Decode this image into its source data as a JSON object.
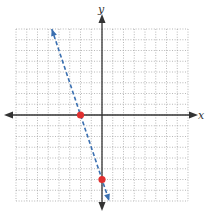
{
  "chart_data": {
    "type": "line",
    "title": "",
    "xlabel": "x",
    "ylabel": "y",
    "xlim": [
      -8,
      8
    ],
    "ylim": [
      -8,
      8
    ],
    "grid": true,
    "grid_style": "dotted",
    "tick_labels": false,
    "series": [
      {
        "name": "line",
        "equation": "y = -3x - 6",
        "style": "dashed",
        "color": "#3a6fb0",
        "arrows": "both",
        "x": [
          -4.67,
          0.67
        ],
        "y": [
          8,
          -8
        ]
      }
    ],
    "points": [
      {
        "x": -2,
        "y": 0,
        "color": "#e03030"
      },
      {
        "x": 0,
        "y": -6,
        "color": "#e03030"
      }
    ]
  },
  "labels": {
    "x_axis": "x",
    "y_axis": "y"
  },
  "colors": {
    "axis": "#333333",
    "grid": "#9a9a9a",
    "line": "#3a6fb0",
    "point": "#e03030"
  }
}
